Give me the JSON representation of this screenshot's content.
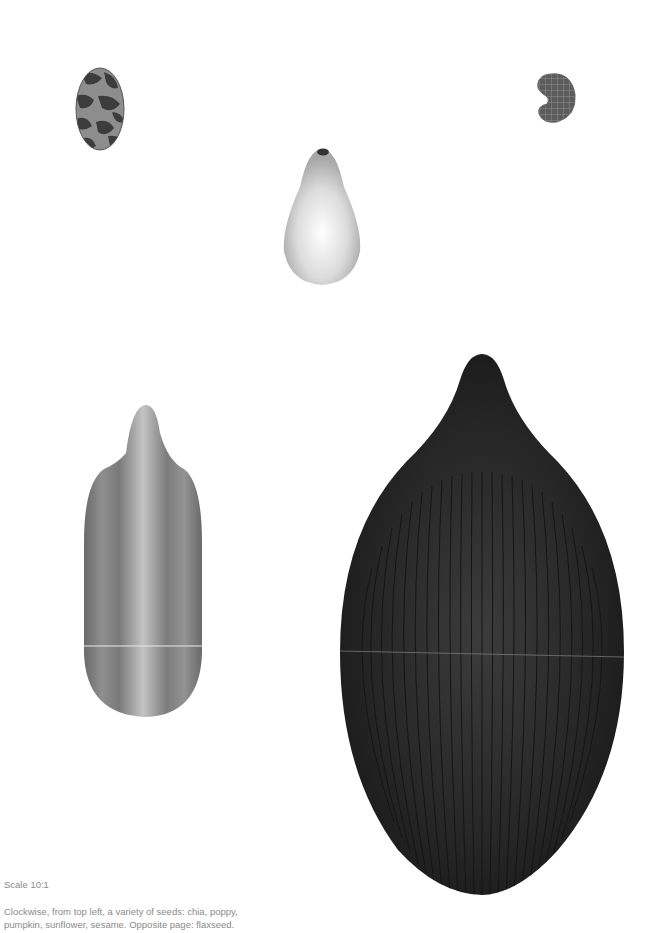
{
  "page": {
    "background": "#ffffff",
    "scale_label": "Scale 10:1",
    "caption_lines": [
      "Clockwise, from top left, a variety of seeds: chia, poppy,",
      "pumpkin, sunflower, sesame. Opposite page: flaxseed."
    ]
  },
  "seeds": [
    {
      "name": "chia",
      "position": "top-left",
      "color": "#6e6e6e"
    },
    {
      "name": "poppy",
      "position": "top-right",
      "color": "#5a5a5a"
    },
    {
      "name": "pumpkin",
      "position": "top-center",
      "color": "#d8d8d8"
    },
    {
      "name": "sunflower",
      "position": "bottom-left",
      "color": "#8c8c8c"
    },
    {
      "name": "sesame",
      "position": "bottom-right",
      "color": "#1f1f1f"
    }
  ]
}
